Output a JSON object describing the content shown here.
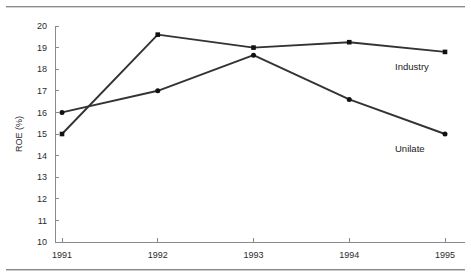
{
  "chart_data": {
    "type": "line",
    "title": "",
    "xlabel": "",
    "ylabel": "ROE (%)",
    "categories": [
      "1991",
      "1992",
      "1993",
      "1994",
      "1995"
    ],
    "x": [
      1991,
      1992,
      1993,
      1994,
      1995
    ],
    "ylim": [
      10,
      20
    ],
    "yticks": [
      10,
      11,
      12,
      13,
      14,
      15,
      16,
      17,
      18,
      19,
      20
    ],
    "ytick_labels": [
      "10",
      "11",
      "12",
      "13",
      "14",
      "15",
      "16",
      "17",
      "18",
      "19",
      "20"
    ],
    "grid": false,
    "legend_position": "inline-right-end-labels",
    "series": [
      {
        "name": "Industry",
        "values": [
          15.0,
          19.6,
          19.0,
          19.25,
          18.8
        ],
        "color": "#333333",
        "marker": "square",
        "label_text": "Industry"
      },
      {
        "name": "Unilate",
        "values": [
          16.0,
          17.0,
          18.65,
          16.6,
          15.0
        ],
        "color": "#333333",
        "marker": "circle",
        "label_text": "Unilate"
      }
    ],
    "annotations": [
      {
        "text": "Industry",
        "series": "Industry",
        "near_x": 1995
      },
      {
        "text": "Unilate",
        "series": "Unilate",
        "near_x": 1995
      }
    ]
  },
  "figure": {
    "background_color": "#ffffff",
    "axis_color": "#8a8a8a",
    "line_color": "#333333",
    "text_color": "#1a1a1a",
    "top_rule": "",
    "bottom_rule": ""
  }
}
